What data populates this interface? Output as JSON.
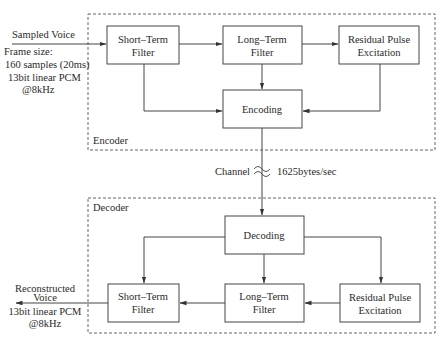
{
  "encoder": {
    "label": "Encoder",
    "input": {
      "label": "Sampled Voice",
      "frame_size_label": "Frame size:",
      "frame_size_value": "160 samples (20ms)",
      "format_line1": "13bit linear PCM",
      "format_line2": "@8kHz"
    },
    "blocks": {
      "short_term": {
        "line1": "Short–Term",
        "line2": "Filter"
      },
      "long_term": {
        "line1": "Long–Term",
        "line2": "Filter"
      },
      "residual": {
        "line1": "Residual Pulse",
        "line2": "Excitation"
      },
      "encoding": {
        "label": "Encoding"
      }
    }
  },
  "channel": {
    "label": "Channel",
    "rate": "1625bytes/sec"
  },
  "decoder": {
    "label": "Decoder",
    "output": {
      "line1": "Reconstructed",
      "line2": "Voice",
      "format_line1": "13bit linear PCM",
      "format_line2": "@8kHz"
    },
    "blocks": {
      "decoding": {
        "label": "Decoding"
      },
      "short_term": {
        "line1": "Short–Term",
        "line2": "Filter"
      },
      "long_term": {
        "line1": "Long–Term",
        "line2": "Filter"
      },
      "residual": {
        "line1": "Residual Pulse",
        "line2": "Excitation"
      }
    }
  }
}
